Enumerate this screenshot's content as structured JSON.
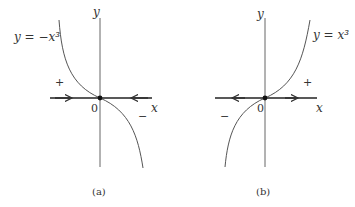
{
  "figure": {
    "panels": [
      {
        "id": "a",
        "caption": "(a)",
        "equation": "y = −x³",
        "y_axis_label": "y",
        "x_axis_label": "x",
        "origin_label": "0",
        "sign_left": "+",
        "sign_right": "−",
        "flow": "arrows point toward origin (stable)"
      },
      {
        "id": "b",
        "caption": "(b)",
        "equation": "y = x³",
        "y_axis_label": "y",
        "x_axis_label": "x",
        "origin_label": "0",
        "sign_left": "−",
        "sign_right": "+",
        "flow": "arrows point away from origin (unstable)"
      }
    ]
  },
  "colors": {
    "curve": "#555555",
    "axis": "#444444",
    "phase_line": "#222222",
    "background": "#ffffff"
  }
}
